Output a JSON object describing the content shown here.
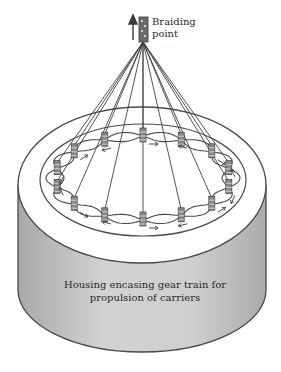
{
  "labels": {
    "braiding_point": [
      "Braiding",
      "point"
    ],
    "housing": [
      "Housing encasing gear train for",
      "propulsion of carriers"
    ]
  },
  "colors": {
    "line": "#4a4a4a",
    "housing_fill": "#c9c9c9",
    "top_fill": "#ffffff",
    "background": "#ffffff"
  },
  "geometry": {
    "apex": [
      143,
      42
    ],
    "outer_ellipse": {
      "cx": 142,
      "cy": 185,
      "rx": 124,
      "ry": 78
    },
    "inner_ellipse": {
      "cx": 143,
      "cy": 180,
      "rx": 103,
      "ry": 56
    },
    "carrier_count": 14
  }
}
